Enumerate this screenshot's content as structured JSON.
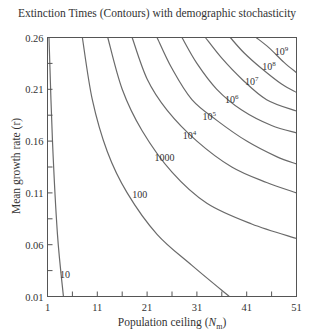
{
  "chart_data": {
    "type": "contour",
    "title": "Extinction Times (Contours) with demographic stochasticity",
    "xlabel": "Population ceiling (N_m)",
    "xlabel_main": "Population ceiling (",
    "xlabel_var": "N",
    "xlabel_sub": "m",
    "xlabel_close": ")",
    "ylabel": "Mean growth rate (r)",
    "xlim": [
      1,
      51
    ],
    "ylim": [
      0.01,
      0.26
    ],
    "x_ticks": [
      1,
      11,
      21,
      31,
      41,
      51
    ],
    "x_tick_labels": [
      "1",
      "11",
      "21",
      "31",
      "41",
      "51"
    ],
    "x_minor_ticks": [
      6,
      16,
      26,
      36,
      46
    ],
    "y_ticks": [
      0.01,
      0.06,
      0.11,
      0.16,
      0.21,
      0.26
    ],
    "y_tick_labels": [
      "0.01",
      "0.06",
      "0.11",
      "0.16",
      "0.21",
      "0.26"
    ],
    "y_minor_ticks": [
      0.035,
      0.085,
      0.135,
      0.185,
      0.235
    ],
    "grid": false,
    "contours": [
      {
        "level": "10",
        "label": "10",
        "label_pos": [
          4.5,
          0.028
        ],
        "points": [
          [
            1.3,
            0.26
          ],
          [
            2.0,
            0.16
          ],
          [
            3.0,
            0.07
          ],
          [
            4.2,
            0.01
          ]
        ]
      },
      {
        "level": "100",
        "label": "100",
        "label_pos": [
          19.5,
          0.105
        ],
        "points": [
          [
            8.0,
            0.26
          ],
          [
            10.0,
            0.2
          ],
          [
            13.0,
            0.15
          ],
          [
            17.0,
            0.11
          ],
          [
            23.0,
            0.07
          ],
          [
            30.0,
            0.04
          ],
          [
            37.5,
            0.01
          ]
        ]
      },
      {
        "level": "1000",
        "label": "1000",
        "label_pos": [
          24.5,
          0.141
        ],
        "points": [
          [
            13.1,
            0.26
          ],
          [
            16.0,
            0.21
          ],
          [
            20.0,
            0.17
          ],
          [
            26.0,
            0.13
          ],
          [
            33.0,
            0.1
          ],
          [
            42.0,
            0.08
          ],
          [
            51.0,
            0.066
          ]
        ]
      },
      {
        "level": "10^4",
        "label": "10",
        "label_sup": "4",
        "label_pos": [
          29.5,
          0.162
        ],
        "points": [
          [
            18.0,
            0.26
          ],
          [
            21.0,
            0.22
          ],
          [
            25.0,
            0.19
          ],
          [
            31.0,
            0.16
          ],
          [
            38.0,
            0.135
          ],
          [
            45.0,
            0.12
          ],
          [
            51.0,
            0.11
          ]
        ]
      },
      {
        "level": "10^5",
        "label": "10",
        "label_sup": "5",
        "label_pos": [
          33.5,
          0.18
        ],
        "points": [
          [
            23.0,
            0.26
          ],
          [
            26.0,
            0.23
          ],
          [
            30.0,
            0.2
          ],
          [
            35.0,
            0.18
          ],
          [
            41.0,
            0.16
          ],
          [
            47.0,
            0.145
          ],
          [
            51.0,
            0.138
          ]
        ]
      },
      {
        "level": "10^6",
        "label": "10",
        "label_sup": "6",
        "label_pos": [
          38.0,
          0.197
        ],
        "points": [
          [
            28.0,
            0.26
          ],
          [
            31.0,
            0.235
          ],
          [
            35.0,
            0.21
          ],
          [
            40.0,
            0.19
          ],
          [
            46.0,
            0.175
          ],
          [
            51.0,
            0.168
          ]
        ]
      },
      {
        "level": "10^7",
        "label": "10",
        "label_sup": "7",
        "label_pos": [
          42.0,
          0.214
        ],
        "points": [
          [
            32.7,
            0.26
          ],
          [
            36.0,
            0.24
          ],
          [
            40.0,
            0.22
          ],
          [
            45.0,
            0.2
          ],
          [
            51.0,
            0.189
          ]
        ]
      },
      {
        "level": "10^8",
        "label": "10",
        "label_sup": "8",
        "label_pos": [
          45.5,
          0.229
        ],
        "points": [
          [
            37.7,
            0.26
          ],
          [
            40.5,
            0.245
          ],
          [
            44.0,
            0.23
          ],
          [
            48.0,
            0.215
          ],
          [
            51.0,
            0.207
          ]
        ]
      },
      {
        "level": "10^9",
        "label": "10",
        "label_sup": "9",
        "label_pos": [
          48.0,
          0.243
        ],
        "points": [
          [
            42.9,
            0.26
          ],
          [
            45.5,
            0.25
          ],
          [
            48.5,
            0.236
          ],
          [
            51.0,
            0.226
          ]
        ]
      }
    ],
    "colors": {
      "line": "#6a6a6a",
      "axis": "#555555",
      "text": "#333333"
    }
  }
}
